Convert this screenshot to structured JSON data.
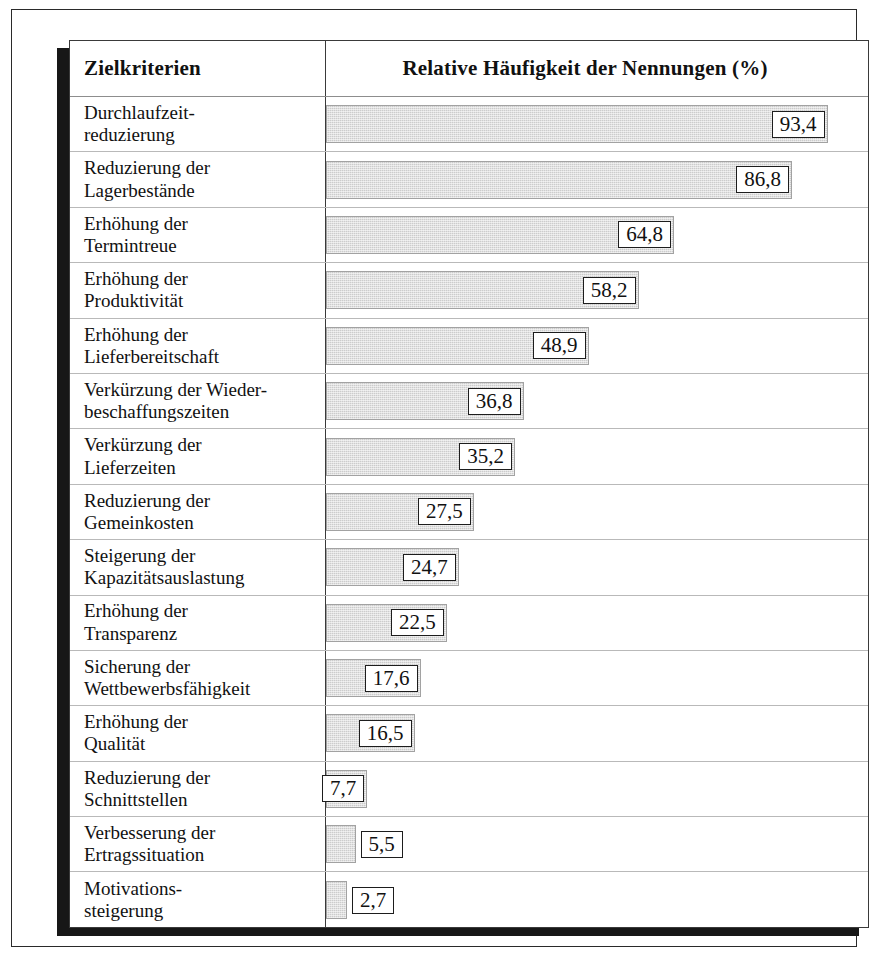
{
  "table": {
    "header": {
      "criteria_label": "Zielkriterien",
      "value_label": "Relative Häufigkeit der Nennungen (%)"
    }
  },
  "chart_data": {
    "type": "bar",
    "orientation": "horizontal",
    "title": "Relative Häufigkeit der Nennungen (%)",
    "xlabel": "Relative Häufigkeit der Nennungen (%)",
    "ylabel": "Zielkriterien",
    "xlim": [
      0,
      100
    ],
    "grid": false,
    "legend": null,
    "decimal_separator": ",",
    "bar_color": "#cccccc",
    "bar_border_color": "#a2a2a2",
    "categories": [
      "Durchlaufzeitreduzierung",
      "Reduzierung der Lagerbestände",
      "Erhöhung der Termintreue",
      "Erhöhung der Produktivität",
      "Erhöhung der Lieferbereitschaft",
      "Verkürzung der Wiederbeschaffungszeiten",
      "Verkürzung der Lieferzeiten",
      "Reduzierung der Gemeinkosten",
      "Steigerung der Kapazitätsauslastung",
      "Erhöhung der Transparenz",
      "Sicherung der Wettbewerbsfähigkeit",
      "Erhöhung der Qualität",
      "Reduzierung der Schnittstellen",
      "Verbesserung der Ertragssituation",
      "Motivationssteigerung"
    ],
    "values": [
      93.4,
      86.8,
      64.8,
      58.2,
      48.9,
      36.8,
      35.2,
      27.5,
      24.7,
      22.5,
      17.6,
      16.5,
      7.7,
      5.5,
      2.7
    ],
    "value_labels": [
      "93,4",
      "86,8",
      "64,8",
      "58,2",
      "48,9",
      "36,8",
      "35,2",
      "27,5",
      "24,7",
      "22,5",
      "17,6",
      "16,5",
      "7,7",
      "5,5",
      "2,7"
    ]
  },
  "rows": [
    {
      "line1": "Durchlaufzeit-",
      "line2": "reduzierung",
      "value": 93.4,
      "value_label": "93,4",
      "label_inside": true
    },
    {
      "line1": "Reduzierung der",
      "line2": "Lagerbestände",
      "value": 86.8,
      "value_label": "86,8",
      "label_inside": true
    },
    {
      "line1": "Erhöhung der",
      "line2": "Termintreue",
      "value": 64.8,
      "value_label": "64,8",
      "label_inside": true
    },
    {
      "line1": "Erhöhung der",
      "line2": "Produktivität",
      "value": 58.2,
      "value_label": "58,2",
      "label_inside": true
    },
    {
      "line1": "Erhöhung der",
      "line2": "Lieferbereitschaft",
      "value": 48.9,
      "value_label": "48,9",
      "label_inside": true
    },
    {
      "line1": "Verkürzung der Wieder-",
      "line2": "beschaffungszeiten",
      "value": 36.8,
      "value_label": "36,8",
      "label_inside": true
    },
    {
      "line1": "Verkürzung der",
      "line2": "Lieferzeiten",
      "value": 35.2,
      "value_label": "35,2",
      "label_inside": true
    },
    {
      "line1": "Reduzierung der",
      "line2": "Gemeinkosten",
      "value": 27.5,
      "value_label": "27,5",
      "label_inside": true
    },
    {
      "line1": "Steigerung der",
      "line2": "Kapazitätsauslastung",
      "value": 24.7,
      "value_label": "24,7",
      "label_inside": true
    },
    {
      "line1": "Erhöhung der",
      "line2": "Transparenz",
      "value": 22.5,
      "value_label": "22,5",
      "label_inside": true
    },
    {
      "line1": "Sicherung der",
      "line2": "Wettbewerbsfähigkeit",
      "value": 17.6,
      "value_label": "17,6",
      "label_inside": true
    },
    {
      "line1": "Erhöhung der",
      "line2": "Qualität",
      "value": 16.5,
      "value_label": "16,5",
      "label_inside": true
    },
    {
      "line1": "Reduzierung der",
      "line2": "Schnittstellen",
      "value": 7.7,
      "value_label": "7,7",
      "label_inside": true
    },
    {
      "line1": "Verbesserung der",
      "line2": "Ertragssituation",
      "value": 5.5,
      "value_label": "5,5",
      "label_inside": false
    },
    {
      "line1": "Motivations-",
      "line2": "steigerung",
      "value": 2.7,
      "value_label": "2,7",
      "label_inside": false
    }
  ]
}
